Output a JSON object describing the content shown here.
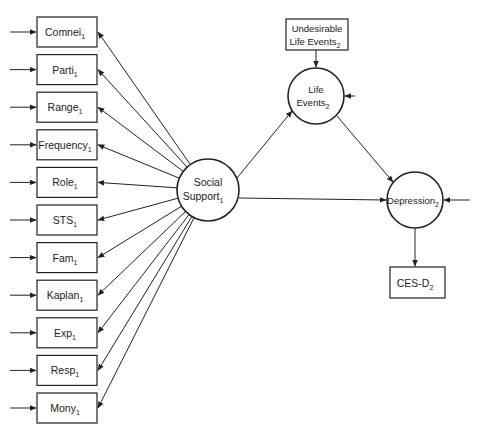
{
  "diagram": {
    "indicators": [
      {
        "name": "Comnei",
        "sub": "1"
      },
      {
        "name": "Parti",
        "sub": "1"
      },
      {
        "name": "Range",
        "sub": "1"
      },
      {
        "name": "Frequency",
        "sub": "1"
      },
      {
        "name": "Role",
        "sub": "1"
      },
      {
        "name": "STS",
        "sub": "1"
      },
      {
        "name": "Fam",
        "sub": "1"
      },
      {
        "name": "Kaplan",
        "sub": "1"
      },
      {
        "name": "Exp",
        "sub": "1"
      },
      {
        "name": "Resp",
        "sub": "1"
      },
      {
        "name": "Mony",
        "sub": "1"
      }
    ],
    "social_support": {
      "line1": "Social",
      "line2": "Support",
      "sub": "1"
    },
    "undesirable": {
      "line1": "Undesirable",
      "line2": "Life Events",
      "sub": "2"
    },
    "life_events": {
      "line1": "Life",
      "line2": "Events",
      "sub": "2"
    },
    "depression": {
      "name": "Depression",
      "sub": "2"
    },
    "cesd": {
      "name": "CES-D",
      "sub": "2"
    }
  }
}
